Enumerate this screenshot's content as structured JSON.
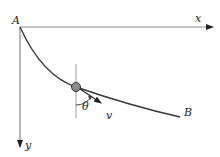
{
  "diagram": {
    "type": "brachistochrone-path",
    "labels": {
      "origin": "A",
      "end_point": "B",
      "x_axis": "x",
      "y_axis": "y",
      "angle": "θ",
      "velocity": "v"
    },
    "colors": {
      "axis": "#8a8a8a",
      "curve": "#3a3a3a",
      "ball_fill": "#8c8c8c",
      "ball_stroke": "#333333",
      "text": "#222222"
    },
    "geometry": {
      "origin": [
        20,
        27
      ],
      "x_axis_end": [
        213,
        27
      ],
      "y_axis_end": [
        20,
        147
      ],
      "curve_end": [
        180,
        117
      ],
      "ball_center": [
        76,
        87
      ],
      "ball_radius": 4.5,
      "velocity_tip": [
        101,
        103
      ],
      "vertical_line": [
        [
          76,
          64
        ],
        [
          76,
          118
        ]
      ]
    }
  }
}
